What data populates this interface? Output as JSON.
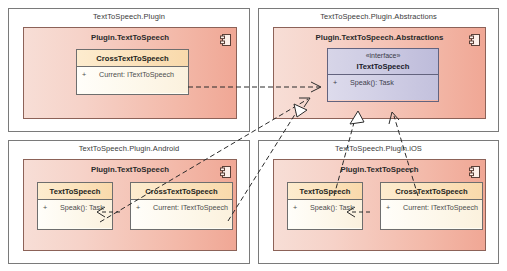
{
  "diagram": {
    "type": "uml-component-diagram",
    "width": 507,
    "height": 271,
    "background": "#ffffff",
    "colors": {
      "panel_border": "#7a7a7a",
      "component_fill_light": "#f7ded6",
      "component_fill_dark": "#f0a795",
      "component_border": "#8c6258",
      "class_header_fill": "#fbe2bb",
      "class_body_fill": "#fffdf4",
      "class_border": "#6e6e6e",
      "interface_fill": "#cdcbe3",
      "interface_border": "#63637e",
      "edge_color": "#2b2b2b"
    }
  },
  "packages": [
    {
      "id": "pkg-plugin",
      "title": "TextToSpeech.Plugin",
      "component": {
        "title": "Plugin.TextToSpeech",
        "icon": "component-icon",
        "classes": [
          {
            "id": "cls-cross-plugin",
            "name": "CrossTextToSpeech",
            "members": [
              {
                "visibility": "+",
                "signature": "Current: ITextToSpeech"
              }
            ]
          }
        ]
      }
    },
    {
      "id": "pkg-abstractions",
      "title": "TextToSpeech.Plugin.Abstractions",
      "component": {
        "title": "Plugin.TextToSpeech.Abstractions",
        "icon": "component-icon",
        "interfaces": [
          {
            "id": "iface-itts",
            "stereotype": "«interface»",
            "name": "ITextToSpeech",
            "members": [
              {
                "visibility": "+",
                "signature": "Speak(): Task"
              }
            ]
          }
        ]
      }
    },
    {
      "id": "pkg-android",
      "title": "TextToSpeech.Plugin.Android",
      "component": {
        "title": "Plugin.TextToSpeech",
        "icon": "component-icon",
        "classes": [
          {
            "id": "cls-tts-android",
            "name": "TextToSpeech",
            "members": [
              {
                "visibility": "+",
                "signature": "Speak(): Task"
              }
            ]
          },
          {
            "id": "cls-cross-android",
            "name": "CrossTextToSpeech",
            "members": [
              {
                "visibility": "+",
                "signature": "Current: ITextToSpeech"
              }
            ]
          }
        ]
      }
    },
    {
      "id": "pkg-ios",
      "title": "TextToSpeech.Plugin.iOS",
      "component": {
        "title": "Plugin.TextToSpeech",
        "icon": "component-icon",
        "classes": [
          {
            "id": "cls-tts-ios",
            "name": "TextToSpeech",
            "members": [
              {
                "visibility": "+",
                "signature": "Speak(): Task"
              }
            ]
          },
          {
            "id": "cls-cross-ios",
            "name": "CrossTextToSpeech",
            "members": [
              {
                "visibility": "+",
                "signature": "Current: ITextToSpeech"
              }
            ]
          }
        ]
      }
    }
  ],
  "relationships": [
    {
      "id": "rel-1",
      "kind": "dependency",
      "from": "cls-cross-plugin",
      "to": "iface-itts",
      "style": "dashed-open-arrow"
    },
    {
      "id": "rel-2",
      "kind": "dependency",
      "from": "cls-cross-android",
      "to": "iface-itts",
      "style": "dashed-open-arrow"
    },
    {
      "id": "rel-3",
      "kind": "dependency",
      "from": "cls-cross-ios",
      "to": "iface-itts",
      "style": "dashed-open-arrow"
    },
    {
      "id": "rel-4",
      "kind": "realization",
      "from": "cls-tts-android",
      "to": "iface-itts",
      "style": "dashed-hollow-triangle"
    },
    {
      "id": "rel-5",
      "kind": "realization",
      "from": "cls-tts-ios",
      "to": "iface-itts",
      "style": "dashed-hollow-triangle"
    },
    {
      "id": "rel-6",
      "kind": "dependency",
      "from": "cls-cross-android",
      "to": "cls-tts-android",
      "style": "dashed-open-arrow"
    },
    {
      "id": "rel-7",
      "kind": "dependency",
      "from": "cls-cross-ios",
      "to": "cls-tts-ios",
      "style": "dashed-open-arrow"
    }
  ]
}
